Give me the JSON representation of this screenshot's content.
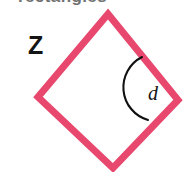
{
  "figure": {
    "type": "geometry-diagram",
    "shape_name": "rhombus",
    "width": 184,
    "height": 172,
    "background_color": "#ffffff",
    "heading": {
      "text": "rectangles",
      "clipped": "true"
    },
    "shape": {
      "stroke_color": "#e8476e",
      "stroke_width": 7,
      "fill": "none",
      "vertices": [
        {
          "name": "top",
          "x": 108,
          "y": 14
        },
        {
          "name": "right",
          "x": 178,
          "y": 100
        },
        {
          "name": "bottom",
          "x": 113,
          "y": 168
        },
        {
          "name": "left",
          "x": 38,
          "y": 97
        }
      ],
      "points": "108,14 178,100 113,168 38,97"
    },
    "angle_marker": {
      "color": "#111111",
      "stroke_width": 2.1,
      "at_vertex": "right",
      "path": "M 142 57 A 34 34 0 0 0 148 120"
    },
    "labels": [
      {
        "id": "z",
        "text": "Z",
        "style": "bold",
        "x": 28,
        "y": 33,
        "color": "#141414"
      },
      {
        "id": "d",
        "text": "d",
        "style": "italic",
        "x": 148,
        "y": 83,
        "color": "#141414"
      }
    ]
  }
}
